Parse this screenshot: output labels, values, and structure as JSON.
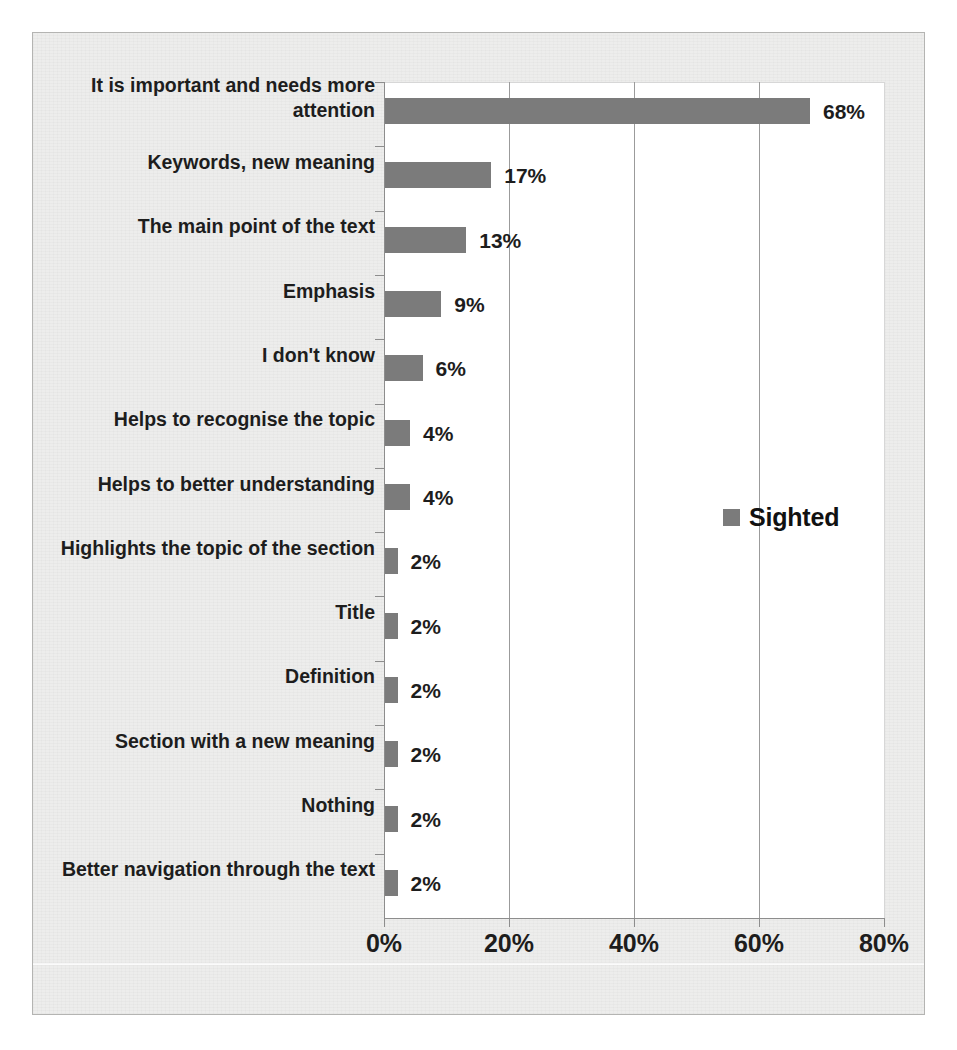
{
  "chart_data": {
    "type": "bar",
    "orientation": "horizontal",
    "title": "",
    "subtitle": "",
    "xlabel": "",
    "ylabel": "",
    "xlim": [
      0,
      80
    ],
    "xtick_labels": [
      "0%",
      "20%",
      "40%",
      "60%",
      "80%"
    ],
    "xticks": [
      0,
      20,
      40,
      60,
      80
    ],
    "grid": "vertical",
    "legend_position": "right-middle",
    "categories": [
      "It is important and needs more attention",
      "Keywords, new meaning",
      "The main point of the text",
      "Emphasis",
      "I don't know",
      "Helps to recognise the topic",
      "Helps to better understanding",
      "Highlights the topic of the section",
      "Title",
      "Definition",
      "Section with a new meaning",
      "Nothing",
      "Better navigation through the text"
    ],
    "series": [
      {
        "name": "Sighted",
        "color": "#7b7b7b",
        "values": [
          68,
          17,
          13,
          9,
          6,
          4,
          4,
          2,
          2,
          2,
          2,
          2,
          2
        ],
        "data_labels": [
          "68%",
          "17%",
          "13%",
          "9%",
          "6%",
          "4%",
          "4%",
          "2%",
          "2%",
          "2%",
          "2%",
          "2%",
          "2%"
        ]
      }
    ]
  },
  "legend": {
    "entries": [
      {
        "label": "Sighted",
        "color": "#7b7b7b",
        "marker": "square-swatch"
      }
    ]
  },
  "colors": {
    "bar": "#7b7b7b",
    "plot_background": "#ffffff",
    "page_background": "#ededec",
    "frame_border": "#b4b4b2",
    "gridline": "#9b9b9b",
    "axis": "#8d8d8d",
    "text": "#1d1d1d"
  }
}
